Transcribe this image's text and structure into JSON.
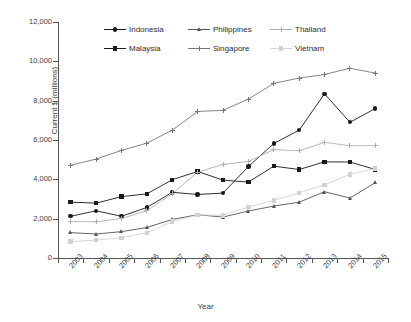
{
  "chart_data": {
    "type": "line",
    "title": "",
    "xlabel": "Year",
    "ylabel": "Current $ (millions)",
    "categories": [
      "2003",
      "2004",
      "2005",
      "2006",
      "2007",
      "2008",
      "2009",
      "2010",
      "2011",
      "2012",
      "2013",
      "2014",
      "2015"
    ],
    "x": [
      2003,
      2004,
      2005,
      2006,
      2007,
      2008,
      2009,
      2010,
      2011,
      2012,
      2013,
      2014,
      2015
    ],
    "ylim": [
      0,
      12000
    ],
    "yticks": [
      0,
      2000,
      4000,
      6000,
      8000,
      10000,
      12000
    ],
    "ytick_labels": [
      "0",
      "2,000",
      "4,000",
      "6,000",
      "8,000",
      "10,000",
      "12,000"
    ],
    "grid": false,
    "legend_position": "top-center",
    "series": [
      {
        "name": "Indonesia",
        "marker": "circle",
        "color": "#1a1a1a",
        "values": [
          2120,
          2400,
          2120,
          2570,
          3340,
          3230,
          3300,
          4650,
          5820,
          6500,
          8350,
          6900,
          7600
        ]
      },
      {
        "name": "Malaysia",
        "marker": "square",
        "color": "#1a1a1a",
        "values": [
          2840,
          2790,
          3120,
          3260,
          3980,
          4400,
          3960,
          3860,
          4670,
          4500,
          4890,
          4880,
          4500
        ]
      },
      {
        "name": "Philippines",
        "marker": "triangle",
        "color": "#555555",
        "values": [
          1290,
          1220,
          1340,
          1550,
          1960,
          2200,
          2080,
          2390,
          2640,
          2840,
          3370,
          3050,
          3830
        ]
      },
      {
        "name": "Singapore",
        "marker": "plus",
        "color": "#777777",
        "values": [
          4720,
          5030,
          5470,
          5840,
          6500,
          7450,
          7510,
          8080,
          8880,
          9150,
          9330,
          9650,
          9400
        ]
      },
      {
        "name": "Thailand",
        "marker": "plus",
        "color": "#b0b0b0",
        "values": [
          1850,
          1840,
          2010,
          2400,
          3270,
          4370,
          4760,
          4910,
          5510,
          5450,
          5880,
          5710,
          5710
        ]
      },
      {
        "name": "Vietnam",
        "marker": "square",
        "color": "#d2d2d2",
        "values": [
          830,
          910,
          1030,
          1280,
          1850,
          2190,
          2170,
          2600,
          2930,
          3320,
          3720,
          4250,
          4560
        ]
      }
    ]
  },
  "axes": {
    "y_title": "Current $ (millions)",
    "x_title": "Year"
  },
  "legend": {
    "items": [
      {
        "label": "Indonesia"
      },
      {
        "label": "Philippines"
      },
      {
        "label": "Thailand"
      },
      {
        "label": "Malaysia"
      },
      {
        "label": "Singapore"
      },
      {
        "label": "Vietnam"
      }
    ]
  }
}
